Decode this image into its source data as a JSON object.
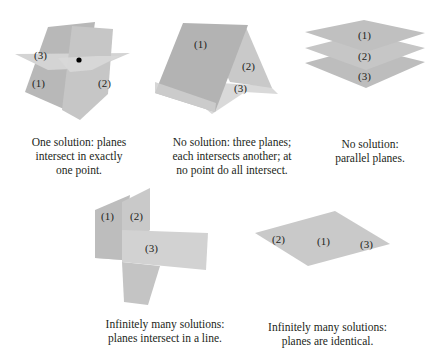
{
  "figures": [
    {
      "id": "one-solution",
      "labels": [
        "(1)",
        "(2)",
        "(3)"
      ],
      "caption": [
        "One solution: planes",
        "intersect in exactly",
        "one point."
      ]
    },
    {
      "id": "no-solution-three-planes",
      "labels": [
        "(1)",
        "(2)",
        "(3)"
      ],
      "caption": [
        "No solution: three planes;",
        "each intersects another; at",
        "no point do all intersect."
      ]
    },
    {
      "id": "no-solution-parallel",
      "labels": [
        "(1)",
        "(2)",
        "(3)"
      ],
      "caption": [
        "No solution:",
        "parallel planes."
      ]
    },
    {
      "id": "infinite-line",
      "labels": [
        "(1)",
        "(2)",
        "(3)"
      ],
      "caption": [
        "Infinitely many solutions:",
        "planes intersect in a line."
      ]
    },
    {
      "id": "infinite-identical",
      "labels": [
        "(1)",
        "(2)",
        "(3)"
      ],
      "caption": [
        "Infinitely many solutions:",
        "planes are identical."
      ]
    }
  ],
  "colors": {
    "plane_dark": "#b3b3b3",
    "plane_mid": "#c4c4c4",
    "plane_light": "#d6d6d6",
    "point": "#000000",
    "text": "#231f20"
  }
}
